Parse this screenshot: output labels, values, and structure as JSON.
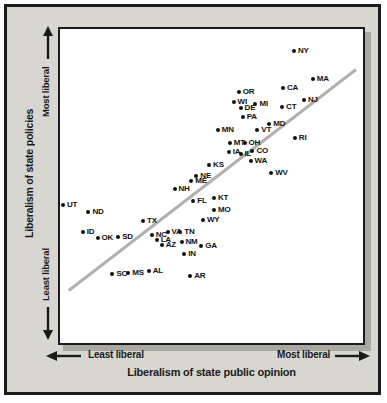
{
  "figure": {
    "y_axis": {
      "title": "Liberalism of state policies",
      "top_label": "Most liberal",
      "bottom_label": "Least liberal"
    },
    "x_axis": {
      "title": "Liberalism of state public opinion",
      "left_label": "Least liberal",
      "right_label": "Most liberal"
    },
    "colors": {
      "figure_background": "#d7d6d1",
      "frame_border": "#1b1b1b",
      "plot_background": "#ffffff",
      "plot_shadow": "#a9a8a2",
      "trend_line": "#b2b1ad",
      "dot": "#111111"
    }
  },
  "chart_data": {
    "type": "scatter",
    "title": "",
    "xlabel": "Liberalism of state public opinion",
    "ylabel": "Liberalism of state policies",
    "x_range_labels": [
      "Least liberal",
      "Most liberal"
    ],
    "y_range_labels": [
      "Least liberal",
      "Most liberal"
    ],
    "axes_note": "qualitative axes, no numeric ticks; x and y given as percent of plot area (0 = least liberal, 100 = most liberal)",
    "grid": false,
    "trend_line": {
      "x1": 2.9,
      "y1": 16.7,
      "x2": 97.7,
      "y2": 87.1
    },
    "points": [
      {
        "label": "NY",
        "x": 77.2,
        "y": 93.1
      },
      {
        "label": "MA",
        "x": 83.4,
        "y": 84.0
      },
      {
        "label": "CA",
        "x": 73.6,
        "y": 81.1
      },
      {
        "label": "OR",
        "x": 59.0,
        "y": 79.9
      },
      {
        "label": "NJ",
        "x": 80.5,
        "y": 77.4
      },
      {
        "label": "WI",
        "x": 57.3,
        "y": 76.7
      },
      {
        "label": "MI",
        "x": 64.5,
        "y": 76.1
      },
      {
        "label": "CT",
        "x": 73.3,
        "y": 75.2
      },
      {
        "label": "DE",
        "x": 59.6,
        "y": 74.8
      },
      {
        "label": "PA",
        "x": 60.3,
        "y": 72.0
      },
      {
        "label": "MD",
        "x": 69.1,
        "y": 69.8
      },
      {
        "label": "MN",
        "x": 52.1,
        "y": 67.9
      },
      {
        "label": "VT",
        "x": 65.1,
        "y": 67.9
      },
      {
        "label": "RI",
        "x": 77.5,
        "y": 65.4
      },
      {
        "label": "MT",
        "x": 56.0,
        "y": 63.8
      },
      {
        "label": "OH",
        "x": 60.9,
        "y": 63.8
      },
      {
        "label": "CO",
        "x": 63.5,
        "y": 61.0
      },
      {
        "label": "IA",
        "x": 55.7,
        "y": 60.7
      },
      {
        "label": "IL",
        "x": 59.6,
        "y": 60.1
      },
      {
        "label": "WA",
        "x": 62.9,
        "y": 57.9
      },
      {
        "label": "KS",
        "x": 49.2,
        "y": 56.6
      },
      {
        "label": "WV",
        "x": 69.7,
        "y": 54.1
      },
      {
        "label": "NE",
        "x": 45.0,
        "y": 53.1
      },
      {
        "label": "ME",
        "x": 43.3,
        "y": 51.6
      },
      {
        "label": "NH",
        "x": 37.8,
        "y": 49.1
      },
      {
        "label": "KT",
        "x": 50.8,
        "y": 46.2
      },
      {
        "label": "FL",
        "x": 44.0,
        "y": 45.3
      },
      {
        "label": "UT",
        "x": 1.0,
        "y": 44.0
      },
      {
        "label": "MO",
        "x": 50.8,
        "y": 42.5
      },
      {
        "label": "ND",
        "x": 9.4,
        "y": 41.8
      },
      {
        "label": "WY",
        "x": 47.2,
        "y": 39.3
      },
      {
        "label": "TX",
        "x": 27.4,
        "y": 39.0
      },
      {
        "label": "ID",
        "x": 7.5,
        "y": 35.2
      },
      {
        "label": "VA",
        "x": 35.5,
        "y": 35.2
      },
      {
        "label": "TN",
        "x": 39.7,
        "y": 35.2
      },
      {
        "label": "NC",
        "x": 30.3,
        "y": 34.3
      },
      {
        "label": "SD",
        "x": 19.2,
        "y": 33.6
      },
      {
        "label": "OK",
        "x": 12.4,
        "y": 33.3
      },
      {
        "label": "LA",
        "x": 31.9,
        "y": 32.7
      },
      {
        "label": "NM",
        "x": 40.1,
        "y": 32.1
      },
      {
        "label": "AZ",
        "x": 33.6,
        "y": 31.1
      },
      {
        "label": "GA",
        "x": 46.6,
        "y": 30.8
      },
      {
        "label": "IN",
        "x": 41.0,
        "y": 28.3
      },
      {
        "label": "SC",
        "x": 17.3,
        "y": 22.0
      },
      {
        "label": "MS",
        "x": 22.5,
        "y": 22.3
      },
      {
        "label": "AL",
        "x": 29.3,
        "y": 23.0
      },
      {
        "label": "AR",
        "x": 43.0,
        "y": 21.4
      }
    ]
  }
}
